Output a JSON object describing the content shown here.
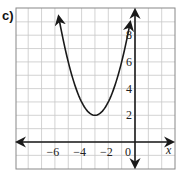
{
  "problem_label": "c)",
  "chart_data": {
    "type": "line",
    "title": "",
    "xlabel": "x",
    "ylabel": "",
    "function": "y = (x + 3)^2 + 2",
    "vertex": [
      -3,
      2
    ],
    "x": [
      -5.6,
      -5,
      -4,
      -3,
      -2,
      -1,
      -0.4
    ],
    "y": [
      8.76,
      6,
      3,
      2,
      3,
      6,
      8.76
    ],
    "xlim": [
      -9,
      3
    ],
    "ylim": [
      -2,
      10
    ],
    "x_tick_labels": [
      "-6",
      "-4",
      "-2",
      "0"
    ],
    "y_tick_labels": [
      "2",
      "4",
      "6",
      "8"
    ],
    "grid": true,
    "arrows": "axes and curve ends have arrowheads"
  },
  "ticks": {
    "x": [
      {
        "value": -6,
        "label": "−6"
      },
      {
        "value": -4,
        "label": "−4"
      },
      {
        "value": -2,
        "label": "−2"
      },
      {
        "value": 0,
        "label": "0"
      }
    ],
    "y": [
      {
        "value": 2,
        "label": "2"
      },
      {
        "value": 4,
        "label": "4"
      },
      {
        "value": 6,
        "label": "6"
      },
      {
        "value": 8,
        "label": "8"
      }
    ]
  },
  "axis_label_x": "x",
  "colors": {
    "grid": "#c8c8c8",
    "axis": "#1a1a1a",
    "curve": "#1a1a1a",
    "frame": "#888888"
  }
}
